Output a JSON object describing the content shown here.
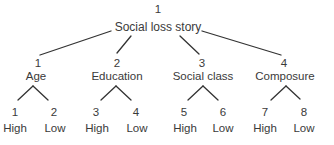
{
  "diagram": {
    "type": "tree",
    "root": {
      "number": "1",
      "label": "Social loss story"
    },
    "branches": [
      {
        "number": "1",
        "label": "Age",
        "leaves": [
          {
            "number": "1",
            "label": "High"
          },
          {
            "number": "2",
            "label": "Low"
          }
        ]
      },
      {
        "number": "2",
        "label": "Education",
        "leaves": [
          {
            "number": "3",
            "label": "High"
          },
          {
            "number": "4",
            "label": "Low"
          }
        ]
      },
      {
        "number": "3",
        "label": "Social class",
        "leaves": [
          {
            "number": "5",
            "label": "High"
          },
          {
            "number": "6",
            "label": "Low"
          }
        ]
      },
      {
        "number": "4",
        "label": "Composure",
        "leaves": [
          {
            "number": "7",
            "label": "High"
          },
          {
            "number": "8",
            "label": "Low"
          }
        ]
      }
    ],
    "colors": {
      "text": "#3a3a3a",
      "lines": "#333333",
      "background": "#ffffff"
    }
  }
}
